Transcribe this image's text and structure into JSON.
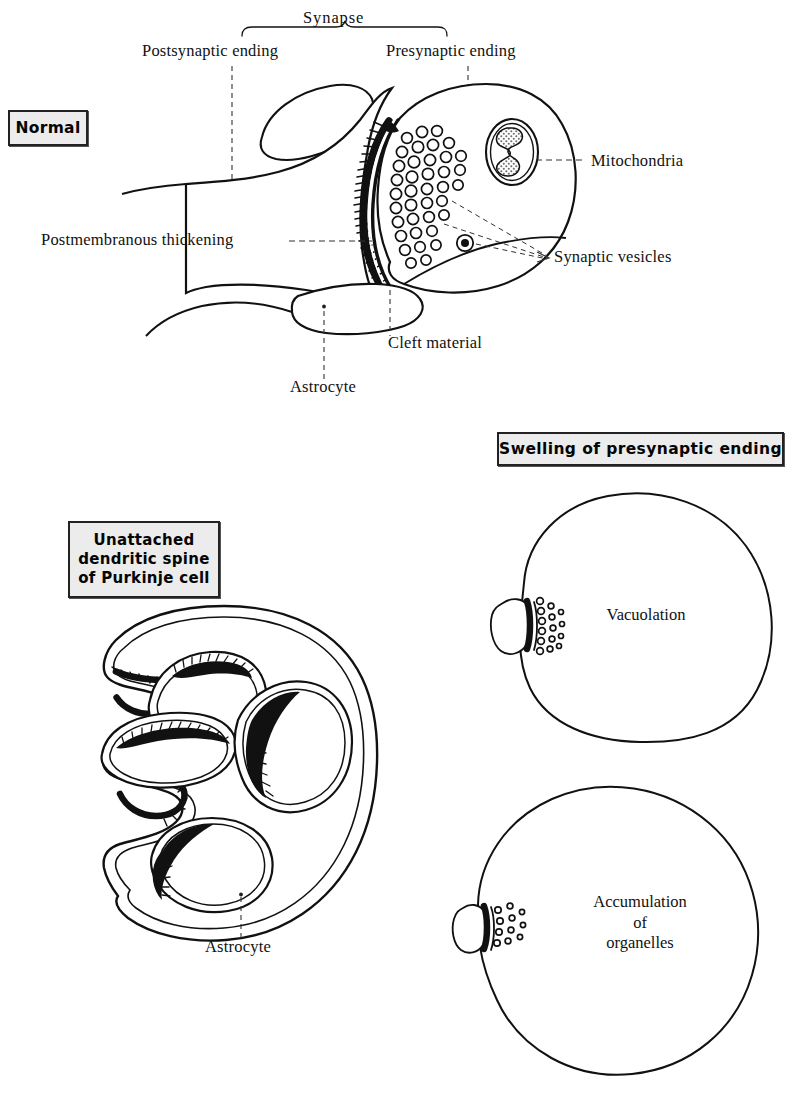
{
  "figure": {
    "type": "anatomical-diagram",
    "panels": [
      {
        "id": "normal",
        "box_label": "Normal",
        "callouts": [
          "Synapse",
          "Postsynaptic ending",
          "Presynaptic ending",
          "Mitochondria",
          "Synaptic vesicles",
          "Postmembranous thickening",
          "Cleft material",
          "Astrocyte"
        ]
      },
      {
        "id": "purkinje",
        "box_label": "Unattached\ndendritic spine\nof Purkinje cell",
        "callouts": [
          "Astrocyte"
        ]
      },
      {
        "id": "swelling",
        "box_label": "Swelling of presynaptic ending",
        "callouts": [
          "Vacuolation",
          "Accumulation\nof\norganelles"
        ]
      }
    ]
  },
  "labels": {
    "normal": "Normal",
    "synapse": "Synapse",
    "postsynaptic_ending": "Postsynaptic ending",
    "presynaptic_ending": "Presynaptic ending",
    "mitochondria": "Mitochondria",
    "synaptic_vesicles": "Synaptic vesicles",
    "postmembranous_thickening": "Postmembranous thickening",
    "cleft_material": "Cleft material",
    "astrocyte_top": "Astrocyte",
    "purkinje_box": "Unattached\ndendritic spine\nof Purkinje cell",
    "astrocyte_bottom": "Astrocyte",
    "swelling_box": "Swelling of presynaptic ending",
    "vacuolation": "Vacuolation",
    "accumulation": "Accumulation\nof\norganelles"
  },
  "colors": {
    "ink": "#111111",
    "paper": "#ffffff",
    "box_fill": "#ececec",
    "box_border": "#222222",
    "stipple": "#8a8a8a"
  }
}
